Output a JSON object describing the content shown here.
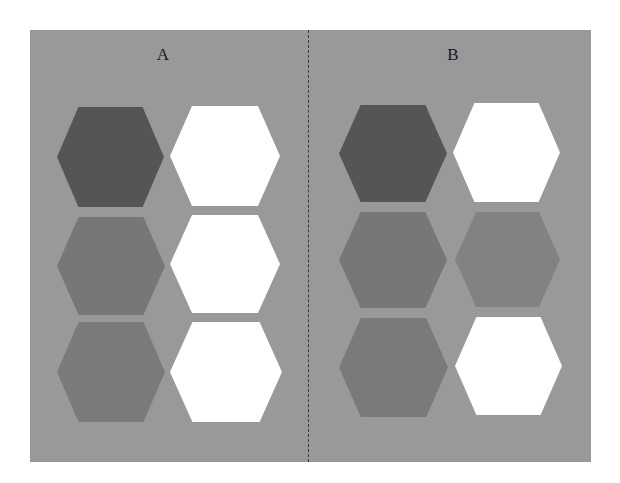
{
  "figure": {
    "background_color": "#999999",
    "divider_style": "dashed",
    "panels": [
      {
        "label": "A",
        "label_x": 133,
        "hexagons": [
          {
            "row": 1,
            "col": 1,
            "shade": "dark",
            "color": "#555555",
            "x": 27,
            "y": 77,
            "w": 107,
            "h": 100
          },
          {
            "row": 1,
            "col": 2,
            "shade": "white",
            "color": "#ffffff",
            "x": 140,
            "y": 76,
            "w": 110,
            "h": 100
          },
          {
            "row": 2,
            "col": 1,
            "shade": "medium",
            "color": "#777777",
            "x": 27,
            "y": 187,
            "w": 108,
            "h": 98
          },
          {
            "row": 2,
            "col": 2,
            "shade": "white",
            "color": "#ffffff",
            "x": 140,
            "y": 185,
            "w": 110,
            "h": 98
          },
          {
            "row": 3,
            "col": 1,
            "shade": "medium",
            "color": "#7a7a7a",
            "x": 27,
            "y": 292,
            "w": 108,
            "h": 100
          },
          {
            "row": 3,
            "col": 2,
            "shade": "white",
            "color": "#ffffff",
            "x": 140,
            "y": 292,
            "w": 112,
            "h": 100
          }
        ]
      },
      {
        "label": "B",
        "label_x": 423,
        "hexagons": [
          {
            "row": 1,
            "col": 1,
            "shade": "dark",
            "color": "#555555",
            "x": 309,
            "y": 75,
            "w": 108,
            "h": 97
          },
          {
            "row": 1,
            "col": 2,
            "shade": "white",
            "color": "#ffffff",
            "x": 423,
            "y": 73,
            "w": 107,
            "h": 99
          },
          {
            "row": 2,
            "col": 1,
            "shade": "medium",
            "color": "#777777",
            "x": 309,
            "y": 182,
            "w": 108,
            "h": 96
          },
          {
            "row": 2,
            "col": 2,
            "shade": "medium-light",
            "color": "#828282",
            "x": 425,
            "y": 182,
            "w": 105,
            "h": 95
          },
          {
            "row": 3,
            "col": 1,
            "shade": "medium",
            "color": "#7a7a7a",
            "x": 309,
            "y": 288,
            "w": 109,
            "h": 99
          },
          {
            "row": 3,
            "col": 2,
            "shade": "white",
            "color": "#ffffff",
            "x": 425,
            "y": 287,
            "w": 107,
            "h": 98
          }
        ]
      }
    ]
  }
}
